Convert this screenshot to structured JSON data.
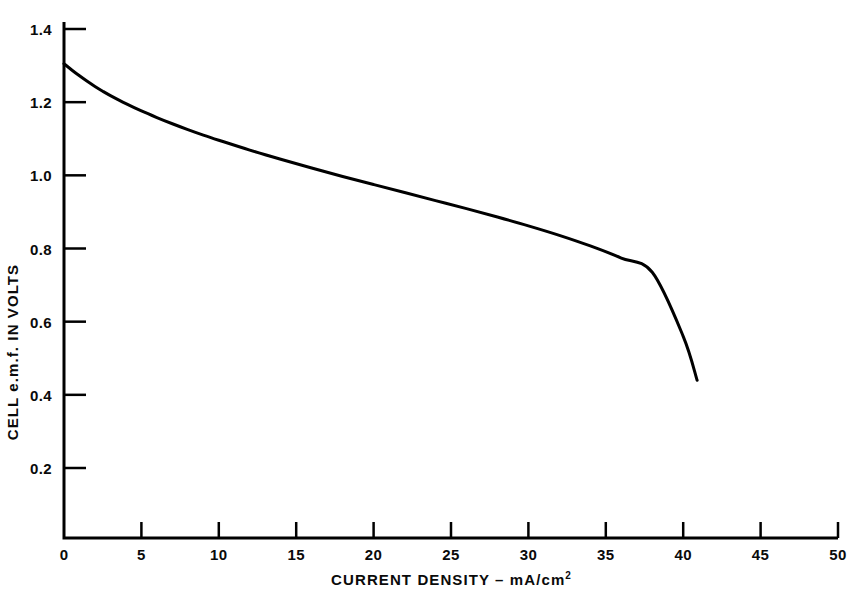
{
  "chart_data": {
    "type": "line",
    "title": "",
    "subtitle": "",
    "xlabel_text": "CURRENT DENSITY – mA/cm",
    "xlabel_superscript": "2",
    "xlabel": "CURRENT DENSITY – mA/cm2",
    "ylabel": "CELL e.m.f. IN VOLTS",
    "xlim": [
      0,
      50
    ],
    "ylim": [
      0,
      1.4
    ],
    "xticks": [
      0,
      5,
      10,
      15,
      20,
      25,
      30,
      35,
      40,
      45,
      50
    ],
    "xtick_labels": [
      "0",
      "5",
      "10",
      "15",
      "20",
      "25",
      "30",
      "35",
      "40",
      "45",
      "50"
    ],
    "yticks": [
      0.2,
      0.4,
      0.6,
      0.8,
      1.0,
      1.2,
      1.4
    ],
    "ytick_labels": [
      "0.2",
      "0.4",
      "0.6",
      "0.8",
      "1.0",
      "1.2",
      "1.4"
    ],
    "grid": false,
    "legend": null,
    "legend_position": "none",
    "annotations": [],
    "series": [
      {
        "name": "cell e.m.f. polarization curve",
        "color": "#000000",
        "line_width": 3,
        "marker": "none",
        "x": [
          0.0,
          0.5,
          1.0,
          1.5,
          2.0,
          2.5,
          3.0,
          4.0,
          5.0,
          6.0,
          7.0,
          8.0,
          9.0,
          10.0,
          12.0,
          14.0,
          16.0,
          18.0,
          20.0,
          22.0,
          24.0,
          26.0,
          28.0,
          30.0,
          32.0,
          34.0,
          36.0,
          38.0,
          40.0,
          40.9
        ],
        "y": [
          1.305,
          1.288,
          1.272,
          1.257,
          1.243,
          1.23,
          1.218,
          1.196,
          1.176,
          1.158,
          1.141,
          1.125,
          1.11,
          1.096,
          1.069,
          1.044,
          1.02,
          0.997,
          0.975,
          0.953,
          0.931,
          0.909,
          0.886,
          0.862,
          0.836,
          0.807,
          0.774,
          0.735,
          0.56,
          0.44
        ]
      }
    ]
  },
  "axes": {
    "y_axis_name": "cell-emf-axis",
    "x_axis_name": "current-density-axis"
  }
}
